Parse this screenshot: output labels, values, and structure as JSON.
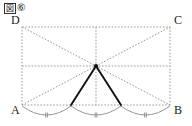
{
  "caption": {
    "box_label": "図",
    "number_label": "⑥",
    "full": "図⑥"
  },
  "figure": {
    "vertices": [
      {
        "id": "A",
        "label": "A",
        "x": 22,
        "y": 105
      },
      {
        "id": "B",
        "label": "B",
        "x": 170,
        "y": 105
      },
      {
        "id": "C",
        "label": "C",
        "x": 170,
        "y": 27
      },
      {
        "id": "D",
        "label": "D",
        "x": 22,
        "y": 27
      }
    ],
    "label_offsets": [
      {
        "id": "A",
        "dx": -11,
        "dy": 9
      },
      {
        "id": "B",
        "dx": 4,
        "dy": 9
      },
      {
        "id": "C",
        "dx": 4,
        "dy": -3
      },
      {
        "id": "D",
        "dx": -11,
        "dy": -3
      }
    ],
    "center_point": {
      "id": "P",
      "x": 96,
      "y": 66
    },
    "base_division_points": [
      {
        "id": "E",
        "x": 71,
        "y": 105
      },
      {
        "id": "F",
        "x": 121,
        "y": 105
      }
    ],
    "rectangle_edges": [
      {
        "from": "D",
        "to": "C",
        "style": "dotted"
      },
      {
        "from": "C",
        "to": "B",
        "style": "dotted"
      },
      {
        "from": "B",
        "to": "A",
        "style": "dotted"
      },
      {
        "from": "A",
        "to": "D",
        "style": "dotted"
      }
    ],
    "dotted_segments": [
      {
        "name": "diagonal-D-B",
        "x1": 22,
        "y1": 27,
        "x2": 170,
        "y2": 105
      },
      {
        "name": "diagonal-A-C",
        "x1": 22,
        "y1": 105,
        "x2": 170,
        "y2": 27
      },
      {
        "name": "midline-horizontal",
        "x1": 22,
        "y1": 66,
        "x2": 170,
        "y2": 66
      },
      {
        "name": "midline-vertical",
        "x1": 96,
        "y1": 27,
        "x2": 96,
        "y2": 105
      },
      {
        "name": "center-to-E",
        "x1": 96,
        "y1": 66,
        "x2": 71,
        "y2": 105
      },
      {
        "name": "center-to-F",
        "x1": 96,
        "y1": 66,
        "x2": 121,
        "y2": 105
      }
    ],
    "solid_segments": [
      {
        "name": "solid-P-E",
        "x1": 96,
        "y1": 66,
        "x2": 71,
        "y2": 105
      },
      {
        "name": "solid-P-F",
        "x1": 96,
        "y1": 66,
        "x2": 121,
        "y2": 105
      }
    ],
    "arcs": [
      {
        "name": "arc-A-E",
        "x1": 22,
        "y1": 106,
        "x2": 71,
        "y2": 106,
        "sag": 9,
        "ticks": 2
      },
      {
        "name": "arc-E-F",
        "x1": 71,
        "y1": 106,
        "x2": 121,
        "y2": 106,
        "sag": 9,
        "ticks": 2
      },
      {
        "name": "arc-F-B",
        "x1": 121,
        "y1": 106,
        "x2": 170,
        "y2": 106,
        "sag": 9,
        "ticks": 2
      }
    ],
    "colors": {
      "ink": "#1a1a1a",
      "dotted": "#9a9a9a",
      "arc": "#8a8a8a",
      "solid": "#111111",
      "background": "#ffffff"
    },
    "stroke_widths": {
      "dotted": 1,
      "solid": 1.9,
      "arc": 0.9
    }
  }
}
